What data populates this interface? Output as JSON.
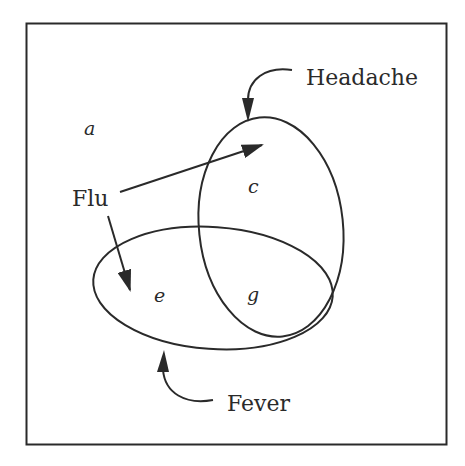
{
  "diagram": {
    "type": "venn",
    "sets": [
      {
        "name": "Headache",
        "label": "Headache"
      },
      {
        "name": "Fever",
        "label": "Fever"
      },
      {
        "name": "Flu",
        "label": "Flu"
      }
    ],
    "regions": [
      {
        "id": "a",
        "label": "a",
        "description": "outside all sets"
      },
      {
        "id": "c",
        "label": "c",
        "description": "Headache only"
      },
      {
        "id": "e",
        "label": "e",
        "description": "Fever only"
      },
      {
        "id": "g",
        "label": "g",
        "description": "Headache and Fever"
      }
    ],
    "labels": {
      "headache": "Headache",
      "fever": "Fever",
      "flu": "Flu",
      "a": "a",
      "c": "c",
      "e": "e",
      "g": "g"
    },
    "colors": {
      "stroke": "#2a2a2a",
      "background": "#ffffff"
    }
  }
}
